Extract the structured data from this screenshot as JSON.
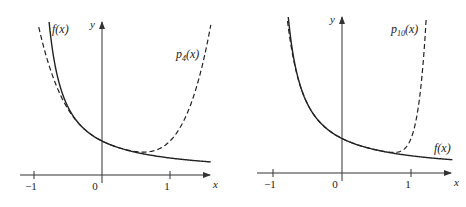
{
  "chart_data": [
    {
      "type": "line",
      "title": "",
      "xlabel": "x",
      "ylabel": "y",
      "x_ticks": [
        "-1",
        "0",
        "1"
      ],
      "series": [
        {
          "name": "f(x)",
          "style": "solid",
          "function": "0.5/(1+x)",
          "x_range": [
            -0.82,
            1.6
          ]
        },
        {
          "name": "p4(x)",
          "label_sub": "4",
          "style": "dashed",
          "function": "0.5*(1-x+x^2-x^3+x^4)",
          "x_range": [
            -0.9,
            1.55
          ]
        }
      ],
      "annotations": [
        {
          "text": "f(x)",
          "position": "upper-left"
        },
        {
          "text": "p4(x)",
          "position": "upper-right"
        }
      ]
    },
    {
      "type": "line",
      "title": "",
      "xlabel": "x",
      "ylabel": "y",
      "x_ticks": [
        "-1",
        "0",
        "1"
      ],
      "series": [
        {
          "name": "f(x)",
          "style": "solid",
          "function": "0.5/(1+x)",
          "x_range": [
            -0.79,
            1.6
          ]
        },
        {
          "name": "p10(x)",
          "label_sub": "10",
          "style": "dashed",
          "function": "0.5*sum_{k=0..10}(-x)^k",
          "x_range": [
            -0.79,
            1.2
          ]
        }
      ],
      "annotations": [
        {
          "text": "p10(x)",
          "position": "upper-right"
        },
        {
          "text": "f(x)",
          "position": "right"
        }
      ]
    }
  ],
  "plots": [
    {
      "ox": 102,
      "oy": 175,
      "unit": 68,
      "xmin_px": 20,
      "xmax_px": 210,
      "ytop_px": 22,
      "ticks": [
        {
          "v": -1,
          "label": "−1"
        },
        {
          "v": 0,
          "label": "0"
        },
        {
          "v": 1,
          "label": "1"
        }
      ],
      "x_label": "x",
      "y_label": "y",
      "f_label": {
        "base": "f",
        "rest": "(x)",
        "x": 52,
        "y": 33
      },
      "p_label": {
        "base": "p",
        "sub": "4",
        "rest": "(x)",
        "x": 176,
        "y": 58
      },
      "f_range": [
        -0.8,
        1.6
      ],
      "p_order": 4,
      "p_range": [
        -0.93,
        1.6
      ]
    },
    {
      "ox": 342,
      "oy": 173,
      "unit": 69,
      "xmin_px": 257,
      "xmax_px": 451,
      "ytop_px": 17,
      "ticks": [
        {
          "v": -1,
          "label": "−1"
        },
        {
          "v": 0,
          "label": "0"
        },
        {
          "v": 1,
          "label": "1"
        }
      ],
      "x_label": "x",
      "y_label": "y",
      "f_label": {
        "base": "f",
        "rest": "(x)",
        "x": 434,
        "y": 152
      },
      "p_label": {
        "base": "p",
        "sub": "10",
        "rest": "(x)",
        "x": 391,
        "y": 33
      },
      "f_range": [
        -0.79,
        1.6
      ],
      "p_order": 10,
      "p_range": [
        -0.79,
        1.35
      ]
    }
  ]
}
